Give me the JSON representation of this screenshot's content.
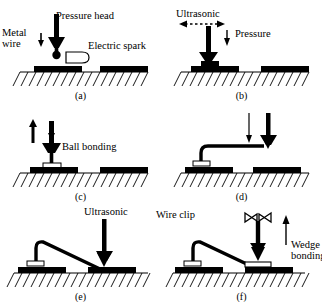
{
  "figure": {
    "name": "wire-bonding-process-schematic",
    "background": "#ffffff",
    "ink": "#000000",
    "rows": 2,
    "cols": 3
  },
  "panels": [
    {
      "id": "a",
      "caption": "(a)",
      "labels": [
        {
          "name": "metal-wire-label",
          "text": "Metal wire"
        },
        {
          "name": "pressure-head-label",
          "text": "Pressure head"
        },
        {
          "name": "electric-spark-label",
          "text": "Electric spark"
        }
      ],
      "elements": [
        "capillary-tool",
        "wire-ball",
        "spark-electrode",
        "bond-pad-left",
        "bond-pad-right",
        "substrate-hatched",
        "down-arrow-wire",
        "down-arrow-head"
      ]
    },
    {
      "id": "b",
      "caption": "(b)",
      "labels": [
        {
          "name": "ultrasonic-label",
          "text": "Ultrasonic"
        },
        {
          "name": "pressure-label",
          "text": "Pressure"
        }
      ],
      "elements": [
        "capillary-tool",
        "ultrasonic-dashed-double-arrow",
        "pressure-down-arrow",
        "ball-bond",
        "bond-pad-left",
        "bond-pad-right",
        "substrate-hatched"
      ]
    },
    {
      "id": "c",
      "caption": "(c)",
      "labels": [
        {
          "name": "ball-bonding-label",
          "text": "Ball bonding"
        }
      ],
      "elements": [
        "capillary-tool",
        "up-arrow",
        "down-arrow",
        "ball-bond",
        "wire-vertical",
        "bond-pad-left",
        "bond-pad-right",
        "substrate-hatched"
      ]
    },
    {
      "id": "d",
      "caption": "(d)",
      "labels": [],
      "elements": [
        "capillary-tool",
        "thin-down-arrow",
        "bold-down-arrow",
        "wire-loop",
        "ball-bond",
        "bond-pad-left",
        "bond-pad-right",
        "substrate-hatched"
      ]
    },
    {
      "id": "e",
      "caption": "(e)",
      "labels": [
        {
          "name": "ultrasonic-label",
          "text": "Ultrasonic"
        }
      ],
      "elements": [
        "capillary-tool",
        "bold-down-arrow",
        "wire-arc",
        "ball-bond",
        "bond-pad-left",
        "bond-pad-right",
        "substrate-hatched"
      ]
    },
    {
      "id": "f",
      "caption": "(f)",
      "labels": [
        {
          "name": "wire-clip-label",
          "text": "Wire clip"
        },
        {
          "name": "wedge-bonding-label",
          "text": "Wedge bonding"
        }
      ],
      "elements": [
        "wire-clip",
        "capillary-tool",
        "bold-down-arrow",
        "up-arrow",
        "wire-arc",
        "wedge-bond",
        "ball-bond",
        "bond-pad-left",
        "bond-pad-right",
        "substrate-hatched"
      ]
    }
  ]
}
